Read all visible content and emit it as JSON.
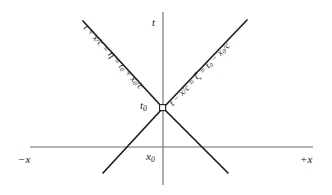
{
  "figure": {
    "type": "spacetime-light-cone-diagram",
    "background_color": "#ffffff",
    "line_color": "#231f20",
    "axis_color": "#6b6b6b",
    "axes": {
      "vertical_label": "t",
      "horizontal_left_label": "−x",
      "horizontal_right_label": "+x"
    },
    "points": {
      "time_label": "t",
      "time_sub": "0",
      "space_label": "x",
      "space_sub": "0"
    },
    "equations": {
      "left": {
        "full": "t + x/c = η = t₀ + x₀/c",
        "lhs": "t + x/c",
        "eq1": " = ",
        "symbol": "η",
        "eq2": " = ",
        "rhs_a": "t",
        "rhs_a_sub": "0",
        "rhs_mid": " + ",
        "rhs_b": "x",
        "rhs_b_sub": "0",
        "rhs_tail": "/c"
      },
      "right": {
        "full": "t − x/c = ζ = t₀ − x₀/c",
        "lhs": "t − x/c",
        "eq1": " = ",
        "symbol": "ζ",
        "eq2": " = ",
        "rhs_a": "t",
        "rhs_a_sub": "0",
        "rhs_mid": " − ",
        "rhs_b": "x",
        "rhs_b_sub": "0",
        "rhs_tail": "/c"
      }
    }
  }
}
